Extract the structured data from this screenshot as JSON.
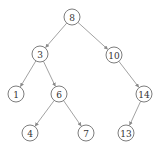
{
  "diagram": {
    "type": "binary-search-tree",
    "root": "8",
    "nodes": [
      {
        "id": "8",
        "label": "8",
        "x": 72,
        "y": 17
      },
      {
        "id": "3",
        "label": "3",
        "x": 40,
        "y": 54
      },
      {
        "id": "10",
        "label": "10",
        "x": 114,
        "y": 55
      },
      {
        "id": "1",
        "label": "1",
        "x": 16,
        "y": 94
      },
      {
        "id": "6",
        "label": "6",
        "x": 59,
        "y": 94
      },
      {
        "id": "14",
        "label": "14",
        "x": 144,
        "y": 94
      },
      {
        "id": "4",
        "label": "4",
        "x": 30,
        "y": 133
      },
      {
        "id": "7",
        "label": "7",
        "x": 86,
        "y": 133
      },
      {
        "id": "13",
        "label": "13",
        "x": 126,
        "y": 133
      }
    ],
    "edges": [
      {
        "from": "8",
        "to": "3"
      },
      {
        "from": "8",
        "to": "10"
      },
      {
        "from": "3",
        "to": "1"
      },
      {
        "from": "3",
        "to": "6"
      },
      {
        "from": "10",
        "to": "14"
      },
      {
        "from": "6",
        "to": "4"
      },
      {
        "from": "6",
        "to": "7"
      },
      {
        "from": "14",
        "to": "13"
      }
    ],
    "node_radius": 8,
    "colors": {
      "edge": "#8a8a8a",
      "node_stroke": "#6e6e6e",
      "text": "#333333"
    }
  }
}
